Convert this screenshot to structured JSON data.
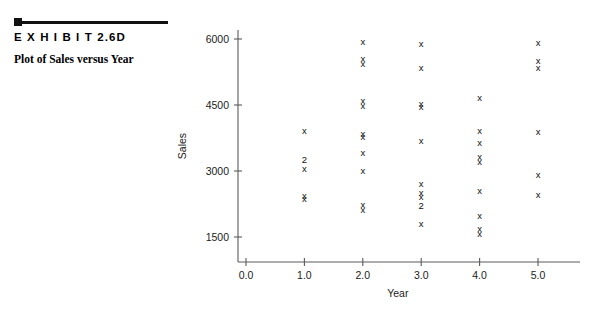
{
  "exhibit": {
    "label": "E X H I B I T  2.6D",
    "caption": "Plot of Sales versus Year"
  },
  "chart_data": {
    "type": "scatter",
    "title": "Plot of Sales versus Year",
    "xlabel": "Year",
    "ylabel": "Sales",
    "xlim": [
      0.0,
      5.6
    ],
    "ylim": [
      1100,
      6250
    ],
    "grid": false,
    "legend": false,
    "xticks": [
      "0.0",
      "1.0",
      "2.0",
      "3.0",
      "4.0",
      "5.0"
    ],
    "xtickvalues": [
      0.0,
      1.0,
      2.0,
      3.0,
      4.0,
      5.0
    ],
    "yticks": [
      "1500",
      "3000",
      "4500",
      "6000"
    ],
    "ytickvalues": [
      1500,
      3000,
      4500,
      6000
    ],
    "marker": "x",
    "overlap_label": "2",
    "note": "Marker label '2' indicates two coincident observations at that location.",
    "points": [
      {
        "x": 1.0,
        "y": 3900,
        "marker": "x",
        "count": 1
      },
      {
        "x": 1.0,
        "y": 3250,
        "marker": "2",
        "count": 2
      },
      {
        "x": 1.0,
        "y": 3040,
        "marker": "x",
        "count": 1
      },
      {
        "x": 1.0,
        "y": 2420,
        "marker": "x",
        "count": 1
      },
      {
        "x": 1.0,
        "y": 2350,
        "marker": "x",
        "count": 1
      },
      {
        "x": 2.0,
        "y": 5920,
        "marker": "x",
        "count": 1
      },
      {
        "x": 2.0,
        "y": 5530,
        "marker": "x",
        "count": 1
      },
      {
        "x": 2.0,
        "y": 5420,
        "marker": "x",
        "count": 1
      },
      {
        "x": 2.0,
        "y": 4580,
        "marker": "x",
        "count": 1
      },
      {
        "x": 2.0,
        "y": 4470,
        "marker": "x",
        "count": 1
      },
      {
        "x": 2.0,
        "y": 3830,
        "marker": "x",
        "count": 1
      },
      {
        "x": 2.0,
        "y": 3760,
        "marker": "x",
        "count": 1
      },
      {
        "x": 2.0,
        "y": 3400,
        "marker": "x",
        "count": 1
      },
      {
        "x": 2.0,
        "y": 3000,
        "marker": "x",
        "count": 1
      },
      {
        "x": 2.0,
        "y": 2220,
        "marker": "x",
        "count": 1
      },
      {
        "x": 2.0,
        "y": 2110,
        "marker": "x",
        "count": 1
      },
      {
        "x": 3.0,
        "y": 5880,
        "marker": "x",
        "count": 1
      },
      {
        "x": 3.0,
        "y": 5320,
        "marker": "x",
        "count": 1
      },
      {
        "x": 3.0,
        "y": 4520,
        "marker": "x",
        "count": 1
      },
      {
        "x": 3.0,
        "y": 4450,
        "marker": "x",
        "count": 1
      },
      {
        "x": 3.0,
        "y": 3660,
        "marker": "x",
        "count": 1
      },
      {
        "x": 3.0,
        "y": 2700,
        "marker": "x",
        "count": 1
      },
      {
        "x": 3.0,
        "y": 2480,
        "marker": "x",
        "count": 1
      },
      {
        "x": 3.0,
        "y": 2400,
        "marker": "x",
        "count": 1
      },
      {
        "x": 3.0,
        "y": 2190,
        "marker": "2",
        "count": 2
      },
      {
        "x": 3.0,
        "y": 1780,
        "marker": "x",
        "count": 1
      },
      {
        "x": 4.0,
        "y": 4650,
        "marker": "x",
        "count": 1
      },
      {
        "x": 4.0,
        "y": 3900,
        "marker": "x",
        "count": 1
      },
      {
        "x": 4.0,
        "y": 3620,
        "marker": "x",
        "count": 1
      },
      {
        "x": 4.0,
        "y": 3300,
        "marker": "x",
        "count": 1
      },
      {
        "x": 4.0,
        "y": 3190,
        "marker": "x",
        "count": 1
      },
      {
        "x": 4.0,
        "y": 2530,
        "marker": "x",
        "count": 1
      },
      {
        "x": 4.0,
        "y": 1960,
        "marker": "x",
        "count": 1
      },
      {
        "x": 4.0,
        "y": 1680,
        "marker": "x",
        "count": 1
      },
      {
        "x": 4.0,
        "y": 1560,
        "marker": "x",
        "count": 1
      },
      {
        "x": 5.0,
        "y": 5890,
        "marker": "x",
        "count": 1
      },
      {
        "x": 5.0,
        "y": 5480,
        "marker": "x",
        "count": 1
      },
      {
        "x": 5.0,
        "y": 5330,
        "marker": "x",
        "count": 1
      },
      {
        "x": 5.0,
        "y": 3880,
        "marker": "x",
        "count": 1
      },
      {
        "x": 5.0,
        "y": 2900,
        "marker": "x",
        "count": 1
      },
      {
        "x": 5.0,
        "y": 2450,
        "marker": "x",
        "count": 1
      }
    ]
  }
}
